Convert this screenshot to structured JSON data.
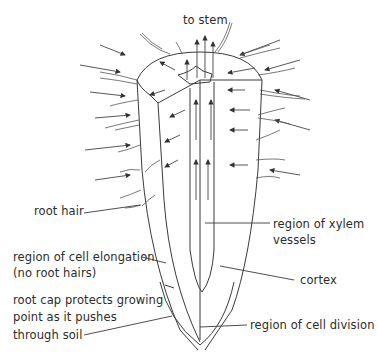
{
  "diagram": {
    "labels": {
      "to_stem": "to stem",
      "root_hair": "root hair",
      "xylem_line1": "region of xylem",
      "xylem_line2": "vessels",
      "elongation_line1": "region of cell elongation",
      "elongation_line2": "(no root hairs)",
      "cortex": "cortex",
      "cap_line1": "root cap protects growing",
      "cap_line2": "point as it pushes",
      "cap_line3": "through soil",
      "division": "region of cell division"
    },
    "colors": {
      "line": "#3a3a3a",
      "background": "#ffffff"
    }
  }
}
